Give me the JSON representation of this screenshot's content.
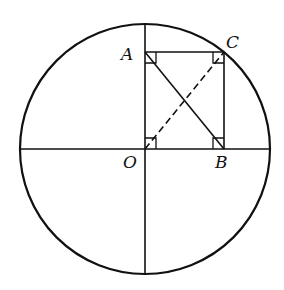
{
  "diagram": {
    "type": "geometry",
    "labels": {
      "A": "A",
      "B": "B",
      "C": "C",
      "O": "O"
    },
    "points": {
      "O": [
        145,
        149
      ],
      "A": [
        145,
        52
      ],
      "B": [
        224,
        149
      ],
      "C": [
        224,
        52
      ]
    },
    "circle": {
      "cx": 145,
      "cy": 149,
      "r": 125
    },
    "segments": [
      {
        "from": "A",
        "to": "C",
        "style": "solid"
      },
      {
        "from": "C",
        "to": "B",
        "style": "solid"
      },
      {
        "from": "A",
        "to": "B",
        "style": "solid"
      },
      {
        "from": "O",
        "to": "C",
        "style": "dashed"
      }
    ],
    "right_angle_marks": [
      "A",
      "C",
      "O",
      "B"
    ],
    "colors": {
      "stroke": "#111111",
      "background": "#ffffff"
    }
  }
}
